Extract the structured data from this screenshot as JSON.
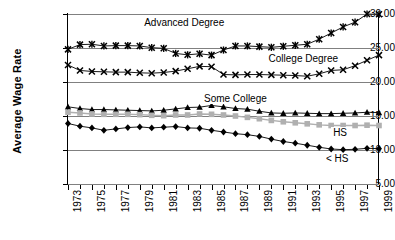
{
  "chart_data": {
    "type": "line",
    "title": "",
    "xlabel": "",
    "ylabel": "Average Wage Rate",
    "ylim": [
      5.0,
      30.0
    ],
    "ytick_values": [
      5.0,
      10.0,
      15.0,
      20.0,
      25.0,
      30.0
    ],
    "ytick_labels": [
      "5.00",
      "10.00",
      "15.00",
      "20.00",
      "25.00",
      "30.00"
    ],
    "xlim": [
      1973,
      1999
    ],
    "x": [
      1973,
      1974,
      1975,
      1976,
      1977,
      1978,
      1979,
      1980,
      1981,
      1982,
      1983,
      1984,
      1985,
      1986,
      1987,
      1988,
      1989,
      1990,
      1991,
      1992,
      1993,
      1994,
      1995,
      1996,
      1997,
      1998,
      1999
    ],
    "xtick_labels": [
      "1973",
      "1975",
      "1977",
      "1979",
      "1981",
      "1983",
      "1985",
      "1987",
      "1989",
      "1991",
      "1993",
      "1995",
      "1997",
      "1999"
    ],
    "grid": true,
    "legend": "inline-annotations",
    "series": [
      {
        "name": "Advanced Degree",
        "marker": "x-cross",
        "color": "#000000",
        "label_x": 1979.2,
        "label_y": 28.6,
        "values": [
          24.8,
          25.5,
          25.55,
          25.3,
          25.35,
          25.35,
          25.3,
          25.05,
          24.95,
          24.2,
          24.0,
          24.15,
          23.95,
          24.7,
          25.3,
          25.3,
          25.2,
          25.1,
          25.25,
          25.4,
          25.55,
          26.3,
          27.2,
          28.1,
          28.8,
          30.0,
          29.95
        ]
      },
      {
        "name": "College Degree",
        "marker": "x",
        "color": "#000000",
        "label_x": 1989.6,
        "label_y": 23.2,
        "values": [
          22.5,
          21.7,
          21.55,
          21.5,
          21.45,
          21.45,
          21.35,
          21.3,
          21.4,
          21.6,
          21.95,
          22.3,
          22.25,
          21.1,
          21.05,
          21.1,
          21.1,
          21.05,
          21.0,
          20.95,
          20.85,
          21.2,
          21.7,
          21.8,
          22.4,
          23.2,
          23.95
        ]
      },
      {
        "name": "Some College",
        "marker": "triangle",
        "color": "#000000",
        "label_x": 1984.2,
        "label_y": 17.3,
        "values": [
          16.35,
          16.1,
          15.95,
          15.95,
          15.9,
          15.85,
          15.8,
          15.75,
          15.85,
          16.05,
          16.25,
          16.3,
          16.55,
          16.35,
          16.1,
          16.0,
          15.7,
          15.45,
          15.4,
          15.45,
          15.4,
          15.35,
          15.35,
          15.4,
          15.45,
          15.55,
          15.5
        ]
      },
      {
        "name": "HS",
        "marker": "square",
        "color": "#b0b0b0",
        "label_x": 1995.0,
        "label_y": 12.3,
        "values": [
          15.55,
          15.45,
          15.3,
          15.25,
          15.25,
          15.25,
          15.2,
          15.1,
          15.05,
          15.15,
          15.15,
          15.3,
          15.25,
          15.15,
          15.0,
          14.8,
          14.6,
          14.35,
          14.15,
          14.0,
          13.85,
          13.7,
          13.6,
          13.6,
          13.6,
          13.65,
          13.6
        ]
      },
      {
        "name": "< HS",
        "marker": "diamond",
        "color": "#000000",
        "label_x": 1994.4,
        "label_y": 8.55,
        "values": [
          13.9,
          13.5,
          13.25,
          12.9,
          13.1,
          13.3,
          13.4,
          13.25,
          13.35,
          13.45,
          13.25,
          13.2,
          12.9,
          12.65,
          12.4,
          12.25,
          12.0,
          11.6,
          11.25,
          11.0,
          10.7,
          10.4,
          10.15,
          10.05,
          10.1,
          10.25,
          10.2
        ]
      }
    ]
  }
}
